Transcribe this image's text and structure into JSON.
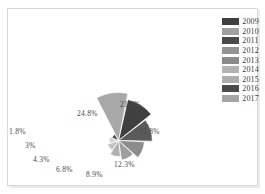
{
  "chart_data": {
    "type": "pie",
    "chart_subtype": "nightingale-rose-polar-area",
    "title": "",
    "subtitle": "",
    "xlabel": "",
    "ylabel": "",
    "legend_position": "right",
    "grid": false,
    "categories": [
      "2009",
      "2010",
      "2011",
      "2012",
      "2013",
      "2014",
      "2015",
      "2016",
      "2017"
    ],
    "values": [
      21.4,
      16.8,
      12.3,
      8.9,
      6.8,
      4.3,
      3.0,
      1.8,
      24.8
    ],
    "value_labels": [
      "21.4%",
      "16.8%",
      "12.3%",
      "8.9%",
      "6.8%",
      "4.3%",
      "3%",
      "1.8%",
      "24.8%"
    ],
    "unit": "%",
    "series": [
      {
        "name": "Share by year",
        "points": [
          {
            "category": "2009",
            "value": 21.4,
            "label": "21.4%",
            "color": "#404040"
          },
          {
            "category": "2010",
            "value": 16.8,
            "label": "16.8%",
            "color": "#5a5a5a"
          },
          {
            "category": "2011",
            "value": 12.3,
            "label": "12.3%",
            "color": "#8c8c8c"
          },
          {
            "category": "2012",
            "value": 8.9,
            "label": "8.9%",
            "color": "#9e9e9e"
          },
          {
            "category": "2013",
            "value": 6.8,
            "label": "6.8%",
            "color": "#b0b0b0"
          },
          {
            "category": "2014",
            "value": 4.3,
            "label": "4.3%",
            "color": "#c2c2c2"
          },
          {
            "category": "2015",
            "value": 3.0,
            "label": "3%",
            "color": "#d4d4d4"
          },
          {
            "category": "2016",
            "value": 1.8,
            "label": "1.8%",
            "color": "#4f4f4f"
          },
          {
            "category": "2017",
            "value": 24.8,
            "label": "24.8%",
            "color": "#a8a8a8"
          }
        ]
      }
    ]
  },
  "legend": {
    "items": [
      {
        "label": "2009",
        "color": "#3f3f3f"
      },
      {
        "label": "2010",
        "color": "#a0a0a0"
      },
      {
        "label": "2011",
        "color": "#4a4a4a"
      },
      {
        "label": "2012",
        "color": "#949494"
      },
      {
        "label": "2013",
        "color": "#8a8a8a"
      },
      {
        "label": "2014",
        "color": "#b3b3b3"
      },
      {
        "label": "2015",
        "color": "#aeaeae"
      },
      {
        "label": "2016",
        "color": "#4b4b4b"
      },
      {
        "label": "2017",
        "color": "#a5a5a5"
      }
    ]
  },
  "labels": {
    "l_21_4": "21.4%",
    "l_16_8": "16.8%",
    "l_12_3": "12.3%",
    "l_8_9": "8.9%",
    "l_6_8": "6.8%",
    "l_4_3": "4.3%",
    "l_3": "3%",
    "l_1_8": "1.8%",
    "l_24_8": "24.8%"
  },
  "colors": {
    "background": "#ffffff",
    "frame_border": "#d9d9d9",
    "label_text": "#4a4a4a",
    "legend_text": "#3b3b3b"
  }
}
